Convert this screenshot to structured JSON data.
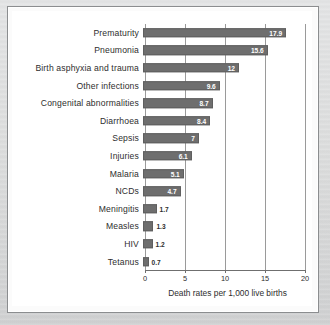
{
  "chart_data": {
    "type": "bar",
    "orientation": "horizontal",
    "title": "",
    "xlabel": "Death rates per 1,000 live births",
    "ylabel": "",
    "xlim": [
      0,
      20
    ],
    "xticks": [
      "0",
      "5",
      "10",
      "15",
      "20"
    ],
    "grid": true,
    "legend": "none",
    "bar_color": "#6e6e6e",
    "categories": [
      "Prematurity",
      "Pneumonia",
      "Birth asphyxia and trauma",
      "Other infections",
      "Congenital abnormalities",
      "Diarrhoea",
      "Sepsis",
      "Injuries",
      "Malaria",
      "NCDs",
      "Meningitis",
      "Measles",
      "HIV",
      "Tetanus"
    ],
    "values": [
      17.9,
      15.6,
      12,
      9.6,
      8.7,
      8.4,
      7,
      6.1,
      5.1,
      4.7,
      1.7,
      1.3,
      1.2,
      0.7
    ],
    "value_labels": [
      "17.9",
      "15.6",
      "12",
      "9.6",
      "8.7",
      "8.4",
      "7",
      "6.1",
      "5.1",
      "4.7",
      "1.7",
      "1.3",
      "1.2",
      "0.7"
    ]
  }
}
